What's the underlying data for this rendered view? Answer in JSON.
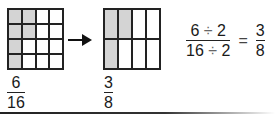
{
  "diagram": {
    "title_cutoff": "",
    "grid_left": {
      "rows": 4,
      "cols": 4,
      "shaded_count": 6,
      "shaded": [
        [
          0,
          0
        ],
        [
          0,
          1
        ],
        [
          1,
          0
        ],
        [
          1,
          1
        ],
        [
          2,
          0
        ],
        [
          3,
          0
        ]
      ]
    },
    "grid_right": {
      "rows": 2,
      "cols": 4,
      "shaded_count": 3,
      "shaded": [
        [
          0,
          0
        ],
        [
          0,
          1
        ],
        [
          1,
          0
        ]
      ]
    },
    "arrow": "→",
    "fraction_left": {
      "numerator": "6",
      "denominator": "16"
    },
    "fraction_right": {
      "numerator": "3",
      "denominator": "8"
    },
    "equation": {
      "numerator": "6",
      "num_divisor": "2",
      "denominator": "16",
      "den_divisor": "2",
      "divide_sign": "÷",
      "equals": "=",
      "result_numerator": "3",
      "result_denominator": "8"
    },
    "colors": {
      "shaded": "#d4d4d4",
      "lines": "#222222"
    }
  }
}
